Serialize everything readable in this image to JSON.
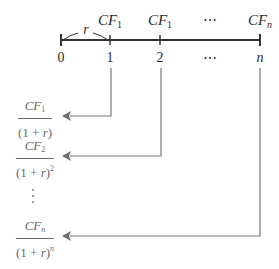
{
  "diagram": {
    "timeline": {
      "rate_label": "r",
      "cash_flows": [
        {
          "base": "CF",
          "sub": "1",
          "x": 110
        },
        {
          "base": "CF",
          "sub": "1",
          "x": 160
        },
        {
          "base": "⋯",
          "sub": "",
          "x": 210
        },
        {
          "base": "CF",
          "sub": "n",
          "x": 260
        }
      ],
      "periods": [
        {
          "label": "0",
          "x": 61
        },
        {
          "label": "1",
          "x": 110
        },
        {
          "label": "2",
          "x": 160
        },
        {
          "label": "⋯",
          "x": 210
        },
        {
          "label": "n",
          "x": 260
        }
      ]
    },
    "discounted_values": [
      {
        "num_base": "CF",
        "num_sub": "1",
        "den_main": "(1 + ",
        "den_var": "r",
        "den_close": ")",
        "exponent": "",
        "y": 116
      },
      {
        "num_base": "CF",
        "num_sub": "2",
        "den_main": "(1 + ",
        "den_var": "r",
        "den_close": ")",
        "exponent": "2",
        "y": 156
      },
      {
        "num_base": "CF",
        "num_sub": "n",
        "den_main": "(1 + ",
        "den_var": "r",
        "den_close": ")",
        "exponent": "n",
        "y": 236
      }
    ],
    "vertical_ellipsis": "⋮",
    "colors": {
      "timeline": "#333333",
      "arrows": "#7a7a7a",
      "fraction_text": "#6a6a6a"
    }
  }
}
